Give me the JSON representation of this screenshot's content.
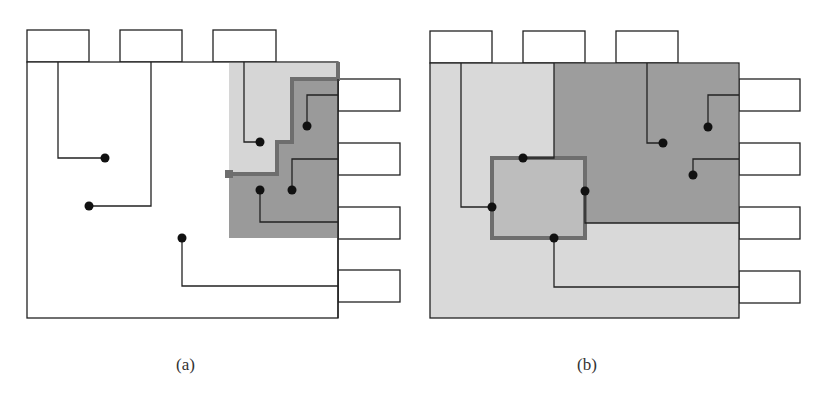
{
  "figure": {
    "panels": [
      {
        "id": "a",
        "caption": "(a)",
        "description": "Chip layout with staircase partition boundary separating light and dark gray regions in top-right corner",
        "colors": {
          "background": "#ffffff",
          "light_region": "#d6d6d6",
          "dark_region": "#9a9a9a",
          "boundary": "#6e6e6e",
          "wire": "#222222",
          "node": "#111111"
        },
        "top_pins": 3,
        "right_pins": 4,
        "nodes": 8
      },
      {
        "id": "b",
        "caption": "(b)",
        "description": "Chip layout with light gray fill, dark gray upper-right region and a highlighted rectangular block bordered in thick gray",
        "colors": {
          "background": "#d9d9d9",
          "dark_region": "#9d9d9d",
          "block": "#bdbdbd",
          "boundary": "#6e6e6e",
          "wire": "#222222",
          "node": "#111111"
        },
        "top_pins": 3,
        "right_pins": 4,
        "nodes": 7
      }
    ]
  }
}
